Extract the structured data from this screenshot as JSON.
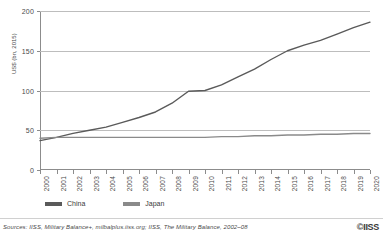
{
  "chart_data": {
    "type": "line",
    "title": "",
    "xlabel": "",
    "ylabel": "US$ (bn, 2015)",
    "ylim": [
      0,
      200
    ],
    "yticks": [
      0,
      50,
      100,
      150,
      200
    ],
    "grid": true,
    "legend_position": "bottom-left",
    "x": [
      2000,
      2001,
      2002,
      2003,
      2004,
      2005,
      2006,
      2007,
      2008,
      2009,
      2010,
      2011,
      2012,
      2013,
      2014,
      2015,
      2016,
      2017,
      2018,
      2019,
      2020
    ],
    "series": [
      {
        "name": "China",
        "color": "#5a5a5a",
        "values": [
          37,
          41,
          46,
          50,
          54,
          60,
          66,
          73,
          84,
          99,
          100,
          107,
          117,
          127,
          139,
          150,
          157,
          163,
          171,
          179,
          186
        ]
      },
      {
        "name": "Japan",
        "color": "#8a8a8a",
        "values": [
          40,
          41,
          41,
          41,
          41,
          41,
          41,
          41,
          41,
          41,
          41,
          42,
          42,
          43,
          43,
          44,
          44,
          45,
          45,
          46,
          46
        ]
      }
    ]
  },
  "axis": {
    "y_title": "US$ (bn, 2015)",
    "y_tick_labels": [
      "0",
      "50",
      "100",
      "150",
      "200"
    ],
    "x_tick_labels": [
      "2000",
      "2001",
      "2002",
      "2003",
      "2004",
      "2005",
      "2006",
      "2007",
      "2008",
      "2009",
      "2010",
      "2011",
      "2012",
      "2013",
      "2014",
      "2015",
      "2016",
      "2017",
      "2018",
      "2019",
      "2020"
    ]
  },
  "legend": {
    "items": [
      {
        "label": "China",
        "color": "#5a5a5a"
      },
      {
        "label": "Japan",
        "color": "#8a8a8a"
      }
    ]
  },
  "footer": {
    "sources": "Sources: IISS, Military Balance+, milbalplus.iiss.org; IISS, The Military Balance, 2002–08",
    "copyright": "©IISS"
  },
  "colors": {
    "china": "#5a5a5a",
    "japan": "#8a8a8a",
    "gridline": "#bdbdbd",
    "axis": "#8c8c8c",
    "text": "#3a3a3a"
  }
}
